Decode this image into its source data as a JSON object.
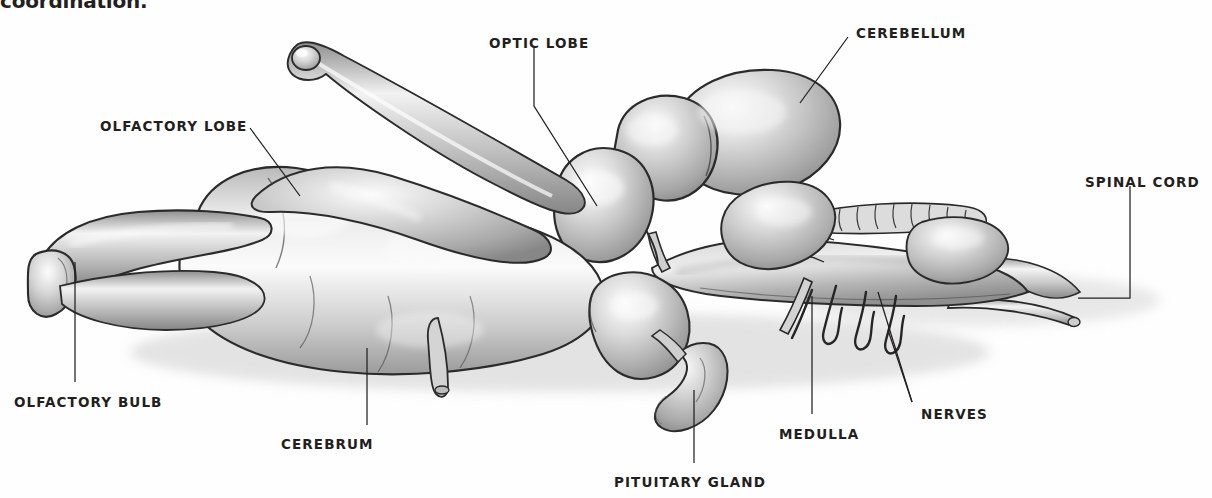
{
  "page": {
    "background_color": "#ffffff",
    "ink_color": "#231f20",
    "truncated_body_text": "coordination."
  },
  "figure": {
    "title_visible": false,
    "style": "graphite pencil shaded anatomical drawing",
    "labels": [
      {
        "id": "olfactory-lobe",
        "text": "OLFACTORY LOBE",
        "x": 100,
        "y": 120
      },
      {
        "id": "optic-lobe",
        "text": "OPTIC LOBE",
        "x": 489,
        "y": 37
      },
      {
        "id": "cerebellum",
        "text": "CEREBELLUM",
        "x": 856,
        "y": 27
      },
      {
        "id": "spinal-cord",
        "text": "SPINAL CORD",
        "x": 1085,
        "y": 176
      },
      {
        "id": "olfactory-bulb",
        "text": "OLFACTORY BULB",
        "x": 14,
        "y": 396
      },
      {
        "id": "cerebrum",
        "text": "CEREBRUM",
        "x": 281,
        "y": 438
      },
      {
        "id": "pituitary-gland",
        "text": "PITUITARY GLAND",
        "x": 614,
        "y": 476
      },
      {
        "id": "medulla",
        "text": "MEDULLA",
        "x": 779,
        "y": 428
      },
      {
        "id": "nerves",
        "text": "NERVES",
        "x": 921,
        "y": 408
      }
    ],
    "leader_lines": [
      {
        "id": "leader-olfactory-lobe",
        "points": "250,128 300,196"
      },
      {
        "id": "leader-optic-lobe",
        "points": "534,48 534,106 597,206"
      },
      {
        "id": "leader-cerebellum",
        "points": "848,37 800,103"
      },
      {
        "id": "leader-spinal-cord",
        "points": "1130,186 1130,298 1078,298"
      },
      {
        "id": "leader-olfactory-bulb",
        "points": "75,382 75,262"
      },
      {
        "id": "leader-cerebrum",
        "points": "367,425 367,348"
      },
      {
        "id": "leader-pituitary",
        "points": "694,463 694,390"
      },
      {
        "id": "leader-medulla",
        "points": "812,414 812,296"
      },
      {
        "id": "leader-nerves-a",
        "points": "912,402 878,292"
      },
      {
        "id": "leader-nerves-b",
        "points": "912,402 888,330"
      }
    ]
  }
}
